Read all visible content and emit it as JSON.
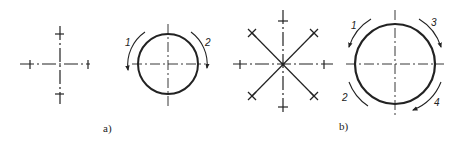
{
  "figure": {
    "panels": [
      {
        "id": "a",
        "caption": "a)",
        "left_view": {
          "type": "cross",
          "arms": 4
        },
        "right_view": {
          "type": "circle-with-arcs",
          "arc_labels": [
            "1",
            "2"
          ]
        }
      },
      {
        "id": "b",
        "caption": "b)",
        "left_view": {
          "type": "star",
          "arms": 8
        },
        "right_view": {
          "type": "circle-with-arcs",
          "arc_labels": [
            "1",
            "3",
            "2",
            "4"
          ]
        }
      }
    ],
    "colors": {
      "ink": "#222222",
      "background": "#ffffff"
    }
  }
}
